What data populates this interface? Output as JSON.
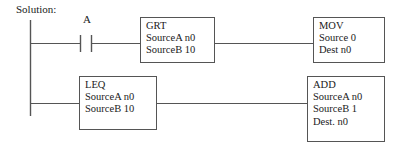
{
  "diagram": {
    "caption": "Solution:",
    "type": "ladder-logic",
    "rungs": [
      {
        "id": "rung-1",
        "contact": {
          "label": "A",
          "type": "normally-open-contact"
        },
        "blocks": [
          "grt",
          "mov"
        ]
      },
      {
        "id": "rung-2",
        "contact": null,
        "blocks": [
          "leq",
          "add"
        ]
      }
    ],
    "blocks": {
      "grt": {
        "name": "GRT",
        "lines": [
          "GRT",
          "SourceA n0",
          "SourceB 10"
        ]
      },
      "mov": {
        "name": "MOV",
        "lines": [
          "MOV",
          "Source 0",
          "Dest n0"
        ]
      },
      "leq": {
        "name": "LEQ",
        "lines": [
          "LEQ",
          "SourceA n0",
          "SourceB 10"
        ]
      },
      "add": {
        "name": "ADD",
        "lines": [
          "ADD",
          "SourceA n0",
          "SourceB 1",
          "Dest. n0"
        ]
      }
    },
    "colors": {
      "line": "#555555",
      "text": "#1a1a1a",
      "background": "#ffffff"
    }
  }
}
